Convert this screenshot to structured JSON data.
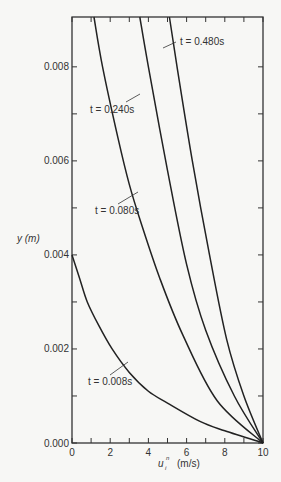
{
  "chart_data": {
    "type": "line",
    "title": "",
    "xlabel": "u_i^n (m/s)",
    "xlabel_parts": {
      "base": "u",
      "sub": "i",
      "sup": "n",
      "unit": "(m/s)"
    },
    "ylabel": "y (m)",
    "xlim": [
      0,
      10
    ],
    "ylim": [
      0,
      0.00906
    ],
    "x_ticks": [
      0,
      2,
      4,
      6,
      8,
      10
    ],
    "x_tick_labels": [
      "0",
      "2",
      "4",
      "6",
      "8",
      "10"
    ],
    "x_minor_ticks": [
      1,
      3,
      5,
      7,
      9
    ],
    "y_ticks": [
      0.0,
      0.002,
      0.004,
      0.006,
      0.008
    ],
    "y_tick_labels": [
      "0.000",
      "0.002",
      "0.004",
      "0.006",
      "0.008"
    ],
    "y_minor_ticks": [
      0.001,
      0.003,
      0.005,
      0.007
    ],
    "grid": false,
    "legend": "inline labels",
    "series": [
      {
        "name": "t = 0.008s",
        "label": "t = 0.008s",
        "points": [
          [
            0,
            0.004
          ],
          [
            0.4,
            0.0035
          ],
          [
            0.8,
            0.003
          ],
          [
            1.4,
            0.0025
          ],
          [
            2.1,
            0.002
          ],
          [
            3.0,
            0.0015
          ],
          [
            4.0,
            0.0011
          ],
          [
            5.0,
            0.00085
          ],
          [
            6.7,
            0.00046
          ],
          [
            8.0,
            0.00026
          ],
          [
            10,
            0.0
          ]
        ]
      },
      {
        "name": "t = 0.080s",
        "label": "t = 0.080s",
        "points": [
          [
            1.15,
            0.00906
          ],
          [
            1.6,
            0.008
          ],
          [
            2.4,
            0.0065
          ],
          [
            3.0,
            0.0055
          ],
          [
            3.6,
            0.0047
          ],
          [
            4.6,
            0.0035
          ],
          [
            5.8,
            0.0023
          ],
          [
            7.6,
            0.0009
          ],
          [
            10,
            0.0
          ]
        ]
      },
      {
        "name": "t = 0.240s",
        "label": "t = 0.240s",
        "points": [
          [
            3.55,
            0.00906
          ],
          [
            4.0,
            0.008
          ],
          [
            5.0,
            0.0058
          ],
          [
            6.0,
            0.0038
          ],
          [
            7.0,
            0.0024
          ],
          [
            8.5,
            0.001
          ],
          [
            10,
            0.0
          ]
        ]
      },
      {
        "name": "t = 0.480s",
        "label": "t = 0.480s",
        "points": [
          [
            5.1,
            0.00906
          ],
          [
            5.5,
            0.008
          ],
          [
            6.3,
            0.006
          ],
          [
            7.2,
            0.004
          ],
          [
            8.1,
            0.0022
          ],
          [
            9.0,
            0.001
          ],
          [
            10,
            0.0
          ]
        ]
      }
    ]
  },
  "labels": {
    "t0": "t = 0.008s",
    "t1": "t = 0.080s",
    "t2": "t = 0.240s",
    "t3": "t = 0.480s",
    "ylabel": "y (m)",
    "xlabel_base": "u",
    "xlabel_sub": "i",
    "xlabel_sup": "n",
    "xlabel_unit": "(m/s)"
  }
}
